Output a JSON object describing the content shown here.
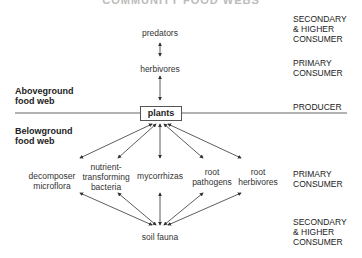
{
  "title": "COMMUNITY FOOD WEBS",
  "sections": {
    "aboveground": "Aboveground food web",
    "aboveground_l1": "Aboveground",
    "aboveground_l2": "food web",
    "belowground_l1": "Belowground",
    "belowground_l2": "food web"
  },
  "levels": {
    "secondary_top_l1": "SECONDARY",
    "secondary_top_l2": "& HIGHER",
    "secondary_top_l3": "CONSUMER",
    "primary_top_l1": "PRIMARY",
    "primary_top_l2": "CONSUMER",
    "producer": "PRODUCER",
    "primary_bottom_l1": "PRIMARY",
    "primary_bottom_l2": "CONSUMER",
    "secondary_bottom_l1": "SECONDARY",
    "secondary_bottom_l2": "& HIGHER",
    "secondary_bottom_l3": "CONSUMER"
  },
  "nodes": {
    "predators": "predators",
    "herbivores": "herbivores",
    "plants": "plants",
    "decomposer_l1": "decomposer",
    "decomposer_l2": "microflora",
    "nutrient_l1": "nutrient-",
    "nutrient_l2": "transforming",
    "nutrient_l3": "bacteria",
    "mycorrhizas": "mycorrhizas",
    "root_pathogens_l1": "root",
    "root_pathogens_l2": "pathogens",
    "root_herbivores_l1": "root",
    "root_herbivores_l2": "herbivores",
    "soil_fauna": "soil fauna"
  },
  "colors": {
    "line": "#444444",
    "text": "#222222"
  }
}
